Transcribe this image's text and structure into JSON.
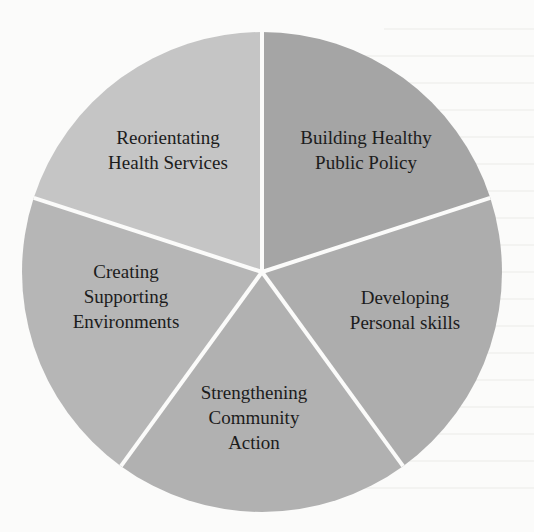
{
  "diagram": {
    "type": "pie",
    "title": "",
    "center": [
      262,
      272
    ],
    "radius": 240,
    "divider_color": "#fbfbfa",
    "divider_width": 4,
    "slices": [
      {
        "id": "building-healthy-public-policy",
        "label_lines": [
          "Building Healthy",
          "Public Policy"
        ],
        "start_deg": 0,
        "end_deg": 72,
        "color": "#a5a5a5",
        "label_pos": [
          366,
          150
        ]
      },
      {
        "id": "developing-personal-skills",
        "label_lines": [
          "Developing",
          "Personal skills"
        ],
        "start_deg": 72,
        "end_deg": 144,
        "color": "#adadad",
        "label_pos": [
          405,
          310
        ]
      },
      {
        "id": "strengthening-community-action",
        "label_lines": [
          "Strengthening",
          "Community",
          "Action"
        ],
        "start_deg": 144,
        "end_deg": 216,
        "color": "#b1b1b1",
        "label_pos": [
          254,
          417
        ]
      },
      {
        "id": "creating-supporting-environments",
        "label_lines": [
          "Creating",
          "Supporting",
          "Environments"
        ],
        "start_deg": 216,
        "end_deg": 288,
        "color": "#b6b6b6",
        "label_pos": [
          126,
          296
        ]
      },
      {
        "id": "reorientating-health-services",
        "label_lines": [
          "Reorientating",
          "Health Services"
        ],
        "start_deg": 288,
        "end_deg": 360,
        "color": "#c5c5c5",
        "label_pos": [
          168,
          150
        ]
      }
    ]
  },
  "chart_data": {
    "type": "pie",
    "title": "",
    "categories": [
      "Building Healthy Public Policy",
      "Developing Personal skills",
      "Strengthening Community Action",
      "Creating Supporting Environments",
      "Reorientating Health Services"
    ],
    "values": [
      20,
      20,
      20,
      20,
      20
    ],
    "legend": "none (labels inside slices)"
  }
}
